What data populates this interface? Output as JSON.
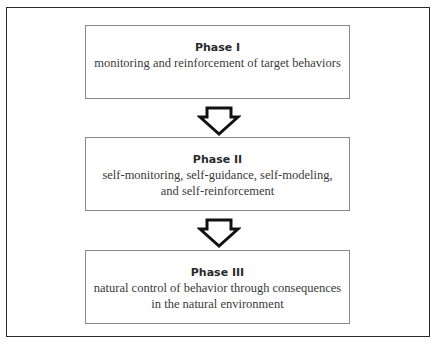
{
  "diagram": {
    "phases": [
      {
        "title": "Phase I",
        "description": "monitoring and reinforcement of target behaviors"
      },
      {
        "title": "Phase II",
        "description": "self-monitoring, self-guidance, self-modeling, and self-reinforcement"
      },
      {
        "title": "Phase III",
        "description": "natural control of behavior through consequences in the natural environment"
      }
    ],
    "arrows": [
      {
        "icon": "down-arrow-icon",
        "from": "Phase I",
        "to": "Phase II"
      },
      {
        "icon": "down-arrow-icon",
        "from": "Phase II",
        "to": "Phase III"
      }
    ],
    "colors": {
      "frame": "#2b2b2b",
      "box_border": "#8a8a8a",
      "text": "#3a3a3a",
      "arrow": "#111111"
    }
  }
}
